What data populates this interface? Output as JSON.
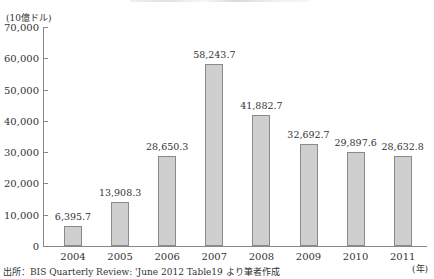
{
  "chart_data": {
    "type": "bar",
    "title": "",
    "ylabel": "(10億ドル)",
    "xlabel": "(年)",
    "categories": [
      "2004",
      "2005",
      "2006",
      "2007",
      "2008",
      "2009",
      "2010",
      "2011"
    ],
    "values": [
      6395.7,
      13908.3,
      28650.3,
      58243.7,
      41882.7,
      32692.7,
      29897.6,
      28632.8
    ],
    "value_labels": [
      "6,395.7",
      "13,908.3",
      "28,650.3",
      "58,243.7",
      "41,882.7",
      "32,692.7",
      "29,897.6",
      "28,632.8"
    ],
    "yticks": [
      "0",
      "10,000",
      "20,000",
      "30,000",
      "40,000",
      "50,000",
      "60,000",
      "70,000"
    ],
    "ylim": [
      0,
      70000
    ],
    "grid": false,
    "legend": null,
    "bar_color": "#cfcfcf",
    "source": "出所：BIS Quarterly Review: 'June 2012 Table19 より筆者作成"
  }
}
